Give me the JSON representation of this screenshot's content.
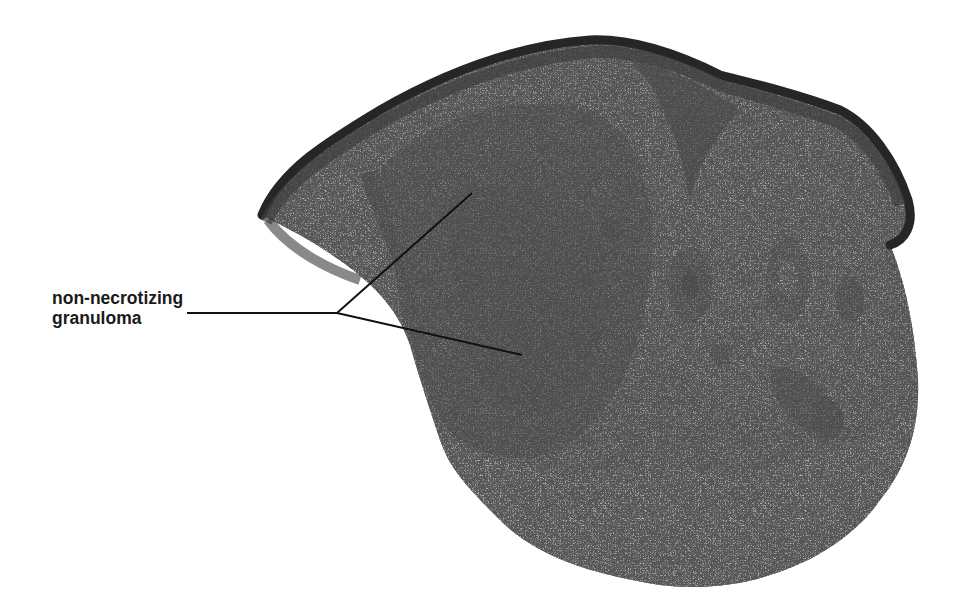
{
  "figure": {
    "annotation": {
      "line1": "non-necrotizing",
      "line2": "granuloma",
      "leader_anchor": [
        337,
        313
      ],
      "leader_start": [
        187,
        313
      ],
      "pointers": [
        [
          472,
          193
        ],
        [
          522,
          355
        ]
      ]
    },
    "colors": {
      "background": "#ffffff",
      "epidermis": "#3a3a3a",
      "granuloma": "#6a6a6a",
      "dermis": "#a8a8a8",
      "label_text": "#1a1a1a"
    }
  }
}
